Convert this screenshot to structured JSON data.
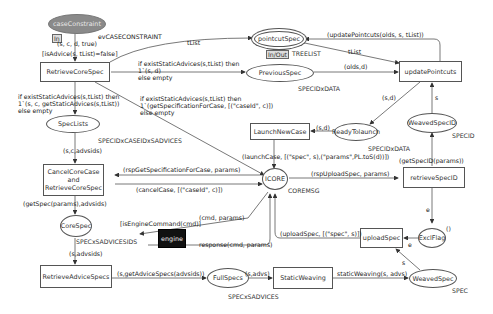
{
  "places": {
    "caseConstraint": {
      "label": "caseConstraint",
      "port": "In"
    },
    "pointcutSpec": {
      "label": "pointcutSpec",
      "port": "In/Out",
      "type": "TREELIST"
    },
    "previousSpec": {
      "label": "PreviousSpec",
      "type": "SPECIDxDATA"
    },
    "specLists": {
      "label": "SpecLists",
      "type": "SPECIDxCASEIDxSADVICES"
    },
    "readyToLaunch": {
      "label": "ReadyTolaunch",
      "type": "SPECIDxDATA"
    },
    "weavedSpecID": {
      "label": "WeavedSpecID",
      "type": "SPECID"
    },
    "icore": {
      "label": "ICORE",
      "type": "COREMSG"
    },
    "coreSpec": {
      "label": "CoreSpec",
      "type": "SPECxSADVICESIDS"
    },
    "exclFlag": {
      "label": "ExclFlag",
      "initial": "()"
    },
    "fullSpecs": {
      "label": "FullSpecs",
      "type": "SPECxSADVICES"
    },
    "weavedSpec": {
      "label": "WeavedSpec",
      "type": "SPEC"
    }
  },
  "transitions": {
    "retrieveCoreSpec": {
      "label": "RetrieveCoreSpec"
    },
    "updatePointcuts": {
      "label": "updatePointcuts"
    },
    "launchNewCase": {
      "label": "LaunchNewCase"
    },
    "cancelCoreCase": {
      "line1": "CancelCoreCase",
      "line2": "and",
      "line3": "RetrieveCoreSpec"
    },
    "retrieveSpecID": {
      "label": "retrieveSpecID"
    },
    "engine": {
      "label": "engine"
    },
    "uploadSpec": {
      "label": "uploadSpec"
    },
    "retrieveAdviceSpecs": {
      "label": "RetrieveAdviceSpecs"
    },
    "staticWeaving": {
      "label": "StaticWeaving"
    }
  },
  "arcs": {
    "caseToRetrieve": "(s, c, d, true)",
    "retrieveGuard": "[isAdvice(s, tList)=false]",
    "evCase": "evCASECONSTRAINT",
    "tListTop": "tList",
    "tListRight": "tList",
    "updateBack": "(updatePointcuts(olds, s, tList))",
    "oldsD": "(olds,d)",
    "prevA": "if existStaticAdvices(s,tList) then",
    "prevB": "1`(s, d)",
    "prevC": "else empty",
    "specListsA": "if existStaticAdvices(s,tList) then",
    "specListsB": "1`(s, c, getStaticAdvices(s,tList))",
    "specListsC": "else empty",
    "icoreA": "if existStaticAdvices(s,tList) then",
    "icoreB": "1`(getSpecificationForCase, [(\"caseId\", c)])",
    "icoreC": "else empty",
    "sD": "(s,d)",
    "sD2": "(s,d)",
    "sCAdvs": "(s,c,advsids)",
    "rspGet": "(rspGetSpecificationForCase, params)",
    "cancelCase": "(cancelCase, [(\"caseId\", c)])",
    "launchCase": "(launchCase, [(\"spec\", s),(\"params\",PL.toS(d))])",
    "rspUpload": "(rspUploadSpec, params)",
    "getSpecID": "(getSpecID(params))",
    "sUp": "s",
    "eDown": "e",
    "eLeft": "e",
    "sDiag": "s",
    "getSpec": "(getSpec(params),advsids)",
    "isEngine": "[isEngineCommand(cmd)]",
    "cmdParams": "(cmd, params)",
    "response": "response(cmd, params)",
    "uploadSpecArc": "(uploadSpec, [(\"spec\", s)])",
    "sAdvsids": "(s,advsids)",
    "getAdvice": "(s,getAdviceSpecs(advsids))",
    "sAdvs": "(s,advs)",
    "staticWeavingArc": "staticWeaving(s, advs)"
  }
}
